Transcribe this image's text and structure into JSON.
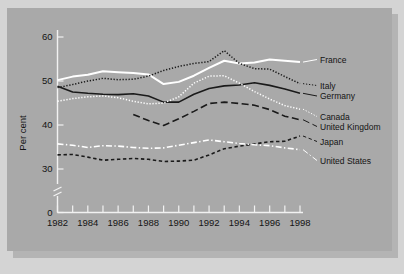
{
  "chart_data": {
    "type": "line",
    "title": "",
    "xlabel": "",
    "ylabel": "Per cent",
    "xlim": [
      1982,
      1998
    ],
    "ylim": [
      0,
      62
    ],
    "y_visible_range": [
      28,
      62
    ],
    "axis_break": true,
    "grid": false,
    "legend_position": "right-inline",
    "y_ticks": [
      "60",
      "50",
      "40",
      "30",
      "0"
    ],
    "y_tick_values": [
      60,
      50,
      40,
      30,
      0
    ],
    "x_ticks": [
      "1982",
      "1984",
      "1986",
      "1988",
      "1990",
      "1992",
      "1994",
      "1996",
      "1998"
    ],
    "x_tick_values": [
      1982,
      1984,
      1986,
      1988,
      1990,
      1992,
      1994,
      1996,
      1998
    ],
    "x_minor_ticks": [
      1983,
      1985,
      1987,
      1989,
      1991,
      1993,
      1995,
      1997
    ],
    "x": [
      1982,
      1983,
      1984,
      1985,
      1986,
      1987,
      1988,
      1989,
      1990,
      1991,
      1992,
      1993,
      1994,
      1995,
      1996,
      1997,
      1998
    ],
    "series": [
      {
        "name": "France",
        "color": "#ffffff",
        "style": "solid",
        "width": 2.0,
        "values": [
          50.2,
          51.0,
          51.4,
          52.2,
          52.0,
          51.8,
          51.5,
          49.3,
          49.8,
          51.2,
          53.0,
          54.6,
          54.0,
          54.2,
          54.9,
          54.6,
          54.3
        ]
      },
      {
        "name": "Italy",
        "color": "#1a1a1a",
        "style": "dotted",
        "width": 1.5,
        "values": [
          48.5,
          49.2,
          50.0,
          50.6,
          50.3,
          50.4,
          51.1,
          52.4,
          53.3,
          54.0,
          54.4,
          56.9,
          54.0,
          52.8,
          52.7,
          51.0,
          49.4
        ]
      },
      {
        "name": "Germany",
        "color": "#1a1a1a",
        "style": "solid",
        "width": 1.6,
        "values": [
          48.8,
          47.5,
          47.2,
          47.0,
          46.9,
          47.1,
          46.6,
          45.2,
          45.2,
          47.0,
          48.3,
          48.9,
          49.1,
          49.6,
          49.0,
          48.2,
          47.2
        ]
      },
      {
        "name": "Canada",
        "color": "#ffffff",
        "style": "dotted",
        "width": 1.5,
        "values": [
          45.4,
          46.0,
          46.4,
          46.6,
          46.2,
          45.4,
          44.8,
          45.0,
          46.4,
          49.5,
          51.1,
          51.2,
          49.5,
          47.6,
          45.9,
          44.4,
          43.6
        ]
      },
      {
        "name": "United Kingdom",
        "color": "#1a1a1a",
        "style": "dashed-long",
        "width": 1.6,
        "values": [
          null,
          null,
          null,
          null,
          null,
          42.4,
          41.0,
          39.9,
          41.4,
          43.1,
          44.9,
          45.2,
          44.9,
          44.5,
          43.5,
          42.0,
          41.2
        ]
      },
      {
        "name": "Japan",
        "color": "#1a1a1a",
        "style": "dashed-short",
        "width": 1.6,
        "values": [
          33.2,
          33.3,
          32.7,
          32.0,
          32.2,
          32.4,
          32.2,
          31.7,
          31.8,
          32.0,
          33.2,
          34.6,
          35.2,
          35.7,
          36.2,
          36.3,
          37.5
        ]
      },
      {
        "name": "United States",
        "color": "#ffffff",
        "style": "dash-dot",
        "width": 1.6,
        "values": [
          35.7,
          35.4,
          34.9,
          35.3,
          35.2,
          34.9,
          34.7,
          34.8,
          35.4,
          36.0,
          36.6,
          36.2,
          35.8,
          35.5,
          35.3,
          34.8,
          34.4
        ]
      }
    ],
    "legend_labels": [
      {
        "name": "France",
        "y_value": 54.3
      },
      {
        "name": "Italy",
        "y_value": 49.4
      },
      {
        "name": "Germany",
        "y_value": 47.2
      },
      {
        "name": "Canada",
        "y_value": 43.6
      },
      {
        "name": "United Kingdom",
        "y_value": 41.2
      },
      {
        "name": "Japan",
        "y_value": 37.5
      },
      {
        "name": "United States",
        "y_value": 34.4
      }
    ]
  },
  "figure": {
    "background_color": "#d4d4d4",
    "panel_color": "#a9a9a9",
    "shadow_color": "#b4b4b4",
    "axis_color": "#f2f2f2",
    "text_color": "#141414"
  }
}
